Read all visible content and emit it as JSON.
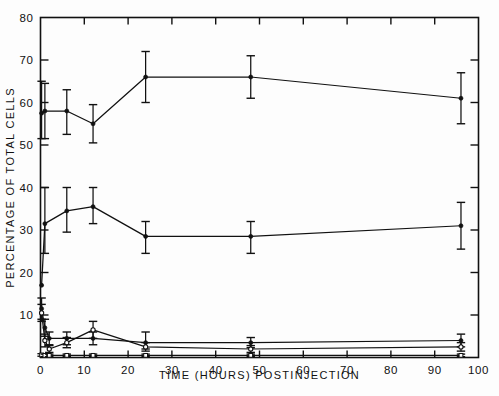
{
  "figure": {
    "background_color": "#fdfdfd",
    "ink_color": "#111111"
  },
  "chart_data": {
    "type": "line",
    "title": "",
    "subtitle": "",
    "xlabel": "TIME (HOURS) POSTINJECTION",
    "ylabel": "PERCENTAGE OF TOTAL CELLS",
    "xlim": [
      0,
      100
    ],
    "ylim": [
      0,
      80
    ],
    "xticks": [
      0,
      10,
      20,
      30,
      40,
      50,
      60,
      70,
      80,
      90,
      100
    ],
    "xtick_labels": [
      "0",
      "10",
      "20",
      "30",
      "40",
      "50",
      "60",
      "70",
      "80",
      "90",
      "100"
    ],
    "yticks": [
      0,
      10,
      20,
      30,
      40,
      50,
      60,
      70,
      80
    ],
    "ytick_labels": [
      "0",
      "10",
      "20",
      "30",
      "40",
      "50",
      "60",
      "70",
      "80"
    ],
    "grid": false,
    "legend": "none",
    "errorbars": "vertical capped",
    "frame": "full box",
    "series": [
      {
        "name": "series-1-upper",
        "marker": "filled-circle",
        "x": [
          0.25,
          1,
          6,
          12,
          24,
          48,
          96
        ],
        "y": [
          57.5,
          58.0,
          58.0,
          55.0,
          66.0,
          66.0,
          61.0
        ],
        "yerr_low": [
          6.0,
          6.5,
          5.5,
          4.5,
          6.0,
          5.0,
          6.0
        ],
        "yerr_high": [
          7.5,
          6.5,
          5.0,
          4.5,
          6.0,
          5.0,
          6.0
        ]
      },
      {
        "name": "series-2-middle",
        "marker": "filled-circle",
        "x": [
          0.25,
          1,
          6,
          12,
          24,
          48,
          96
        ],
        "y": [
          17.0,
          31.5,
          34.5,
          35.5,
          28.5,
          28.5,
          31.0
        ],
        "yerr_low": [
          0.0,
          7.0,
          5.0,
          4.0,
          4.0,
          4.0,
          5.5
        ],
        "yerr_high": [
          0.0,
          8.5,
          5.5,
          4.5,
          3.5,
          3.5,
          5.5
        ]
      },
      {
        "name": "series-3-low-a",
        "marker": "filled-circle",
        "x": [
          0.25,
          1,
          2,
          6,
          12,
          24,
          48,
          96
        ],
        "y": [
          11.5,
          7.0,
          4.5,
          4.5,
          4.5,
          3.5,
          3.5,
          4.0
        ],
        "yerr_low": [
          2.5,
          2.0,
          1.5,
          1.5,
          1.5,
          1.5,
          1.2,
          1.5
        ],
        "yerr_high": [
          2.5,
          2.0,
          1.5,
          1.5,
          1.5,
          2.5,
          1.2,
          1.5
        ]
      },
      {
        "name": "series-4-low-b",
        "marker": "open-circle",
        "x": [
          0.25,
          1,
          2,
          6,
          12,
          24,
          48,
          96
        ],
        "y": [
          10.5,
          4.0,
          2.0,
          3.5,
          6.5,
          2.5,
          2.0,
          2.5
        ],
        "yerr_low": [
          2.0,
          1.5,
          0.8,
          1.2,
          2.0,
          1.0,
          0.8,
          1.0
        ],
        "yerr_high": [
          2.0,
          1.5,
          0.8,
          1.2,
          2.0,
          1.0,
          0.8,
          1.0
        ]
      },
      {
        "name": "series-5-baseline",
        "marker": "open-square",
        "x": [
          0.25,
          1,
          2,
          6,
          12,
          24,
          48,
          96
        ],
        "y": [
          0.6,
          0.5,
          0.5,
          0.5,
          0.5,
          0.5,
          0.5,
          0.5
        ],
        "yerr_low": [
          0.3,
          0.3,
          0.3,
          0.3,
          0.3,
          0.3,
          0.3,
          0.3
        ],
        "yerr_high": [
          0.3,
          0.3,
          0.3,
          0.3,
          0.3,
          0.3,
          0.3,
          0.3
        ]
      }
    ]
  }
}
